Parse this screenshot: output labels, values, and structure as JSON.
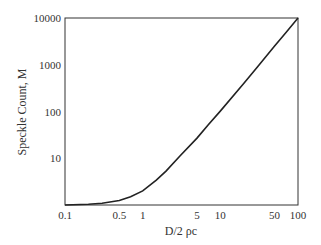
{
  "chart_data": {
    "type": "line",
    "title": "",
    "xlabel": "D/2 ρc",
    "ylabel": "Speckle Count, M",
    "xscale": "log",
    "yscale": "log",
    "xlim": [
      0.1,
      100
    ],
    "ylim": [
      1,
      10000
    ],
    "grid": false,
    "legend": null,
    "x_ticks": [
      "0.1",
      "0.5",
      "1",
      "5",
      "10",
      "50",
      "100"
    ],
    "y_ticks": [
      "10",
      "100",
      "1000",
      "10000"
    ],
    "series": [
      {
        "name": "M",
        "x": [
          0.1,
          0.2,
          0.3,
          0.5,
          0.7,
          1,
          1.5,
          2,
          3,
          5,
          7,
          10,
          20,
          30,
          50,
          70,
          100
        ],
        "y": [
          1.0,
          1.04,
          1.09,
          1.25,
          1.5,
          2.0,
          3.4,
          5.3,
          11,
          27,
          52,
          102,
          400,
          900,
          2500,
          4900,
          10000
        ]
      }
    ]
  }
}
